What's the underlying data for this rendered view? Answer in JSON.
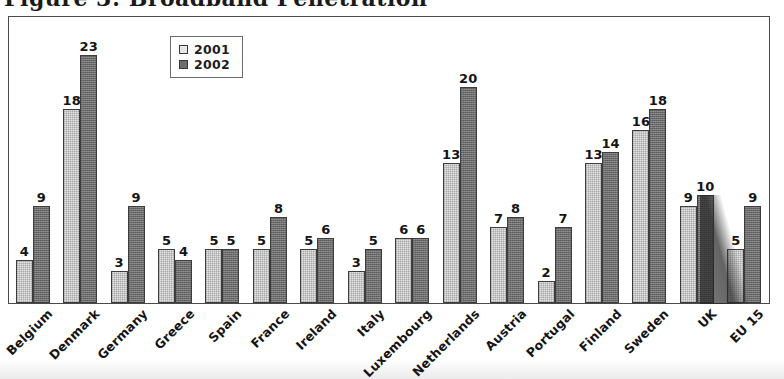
{
  "title": "Figure 3: Broadband Penetration",
  "legend": {
    "position": "top-center-inside",
    "entries": [
      {
        "label": "2001",
        "color": "#e6e6e6",
        "icon": "square-swatch-light"
      },
      {
        "label": "2002",
        "color": "#6e6e6e",
        "icon": "square-swatch-dark"
      }
    ]
  },
  "chart_data": {
    "type": "bar",
    "title": "Figure 3: Broadband Penetration",
    "xlabel": "",
    "ylabel": "",
    "ylim": [
      0,
      25
    ],
    "grid": false,
    "legend_position": "top-center",
    "data_labels": true,
    "categories": [
      "Belgium",
      "Denmark",
      "Germany",
      "Greece",
      "Spain",
      "France",
      "Ireland",
      "Italy",
      "Luxembourg",
      "Netherlands",
      "Austria",
      "Portugal",
      "Finland",
      "Sweden",
      "UK",
      "EU 15"
    ],
    "series": [
      {
        "name": "2001",
        "color": "#e6e6e6",
        "values": [
          4,
          18,
          3,
          5,
          5,
          5,
          5,
          3,
          6,
          13,
          7,
          2,
          13,
          16,
          9,
          5
        ]
      },
      {
        "name": "2002",
        "color": "#6e6e6e",
        "values": [
          9,
          23,
          9,
          4,
          5,
          8,
          6,
          5,
          6,
          20,
          8,
          7,
          14,
          18,
          10,
          9
        ]
      }
    ]
  }
}
